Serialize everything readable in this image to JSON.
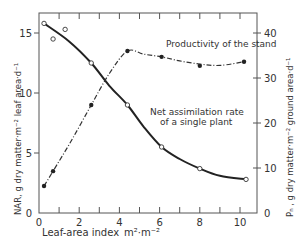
{
  "chart_data": {
    "type": "line",
    "title": "",
    "xlabel": "Leaf-area index",
    "xunit": "m²·m⁻²",
    "ylabel_left": "NAR, g dry matter·m⁻² leaf area·d⁻¹",
    "ylabel_right": "Pₙ , g dry matter·m⁻² ground area·d⁻¹",
    "xlim": [
      0,
      11
    ],
    "ylim_left": [
      0,
      17
    ],
    "ylim_right": [
      0,
      44
    ],
    "xticks": [
      0,
      2,
      4,
      6,
      8,
      10
    ],
    "yticks_left": [
      0,
      5,
      10,
      15
    ],
    "yticks_right": [
      0,
      10,
      20,
      30,
      40
    ],
    "grid": false,
    "series": [
      {
        "name": "Net assimilation rate of a single plant",
        "axis": "left",
        "marker": "open-circle",
        "line": "solid",
        "points": [
          [
            0.25,
            15.8
          ],
          [
            0.7,
            14.5
          ],
          [
            1.3,
            15.3
          ],
          [
            2.6,
            12.5
          ],
          [
            4.4,
            9.0
          ],
          [
            6.1,
            5.5
          ],
          [
            8.0,
            3.7
          ],
          [
            10.3,
            2.8
          ]
        ],
        "curve": [
          [
            0.25,
            15.8
          ],
          [
            1.5,
            14.3
          ],
          [
            2.6,
            12.5
          ],
          [
            3.5,
            10.6
          ],
          [
            4.4,
            9.0
          ],
          [
            5.2,
            7.2
          ],
          [
            6.1,
            5.5
          ],
          [
            7.0,
            4.5
          ],
          [
            8.0,
            3.7
          ],
          [
            9.0,
            3.1
          ],
          [
            10.3,
            2.8
          ]
        ]
      },
      {
        "name": "Productivity of the stand",
        "axis": "right",
        "marker": "filled-circle",
        "line": "dash-dot",
        "points": [
          [
            0.25,
            6
          ],
          [
            0.7,
            9.3
          ],
          [
            2.6,
            24
          ],
          [
            4.4,
            36
          ],
          [
            6.1,
            34.7
          ],
          [
            8.0,
            32.7
          ],
          [
            10.2,
            33.6
          ]
        ],
        "curve": [
          [
            0.25,
            6
          ],
          [
            0.7,
            9.3
          ],
          [
            1.6,
            16
          ],
          [
            2.6,
            24
          ],
          [
            3.5,
            31
          ],
          [
            4.4,
            36
          ],
          [
            5.2,
            35.3
          ],
          [
            6.1,
            34.7
          ],
          [
            7.0,
            33.8
          ],
          [
            8.0,
            33.1
          ],
          [
            9.0,
            32.8
          ],
          [
            10.2,
            33.6
          ]
        ]
      }
    ],
    "annotations": {
      "productivity": "Productivity of the stand",
      "nar_line1": "Net assimilation rate",
      "nar_line2": "of a single plant"
    }
  }
}
